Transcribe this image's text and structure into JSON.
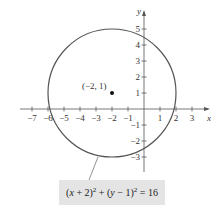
{
  "diagram": {
    "type": "circle-graph",
    "center": {
      "x": -2,
      "y": 1
    },
    "radius": 4,
    "center_label": "(−2, 1)",
    "equation": "(x + 2)² + (y − 1)² = 16",
    "x_axis": {
      "label": "x",
      "ticks": [
        -7,
        -6,
        -5,
        -4,
        -3,
        -2,
        -1,
        1,
        2,
        3
      ],
      "tick_labels": [
        "−7",
        "−6",
        "−5",
        "−4",
        "−3",
        "−2",
        "−1",
        "1",
        "2",
        "3"
      ]
    },
    "y_axis": {
      "label": "y",
      "ticks": [
        5,
        4,
        3,
        2,
        1,
        -1,
        -2,
        -3
      ],
      "tick_labels": [
        "5",
        "4",
        "3",
        "2",
        "1",
        "−1",
        "−2",
        "−3"
      ]
    },
    "colors": {
      "circle": "#555555",
      "axes": "#555555",
      "box": "#e4e4e4"
    }
  }
}
